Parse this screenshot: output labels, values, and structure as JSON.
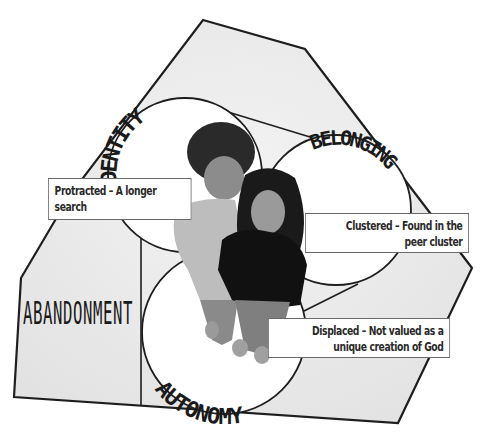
{
  "diagram": {
    "type": "venn-hexagon",
    "colors": {
      "hexagon_fill": "#e8e8e8",
      "circle_fill": "#ffffff",
      "stroke": "#1e1e1e",
      "text": "#1a1a1a",
      "callout_border": "#6a6a6a"
    },
    "circles": [
      {
        "id": "identity",
        "label": "IDENTITY"
      },
      {
        "id": "belonging",
        "label": "BELONGING"
      },
      {
        "id": "autonomy",
        "label": "AUTONOMY"
      }
    ],
    "outer_label": "ABANDONMENT",
    "callouts": {
      "identity": {
        "line1": "Protracted – A longer",
        "line2": "search"
      },
      "belonging": {
        "line1": "Clustered – Found in the",
        "line2": "peer cluster"
      },
      "autonomy": {
        "line1": "Displaced – Not valued as a",
        "line2": "unique creation of God"
      }
    },
    "photo": {
      "description": "Two teenagers standing, viewed from above"
    }
  }
}
